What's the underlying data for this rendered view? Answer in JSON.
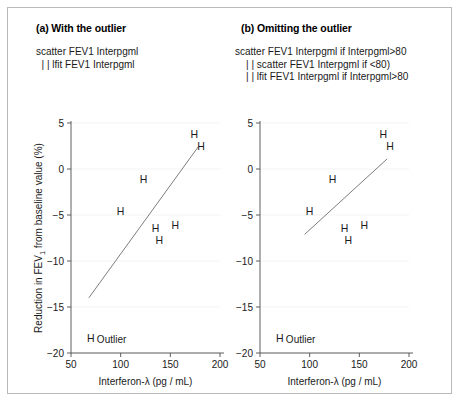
{
  "figure": {
    "panels": [
      {
        "id": "a",
        "title": "(a) With the outlier",
        "commands": "scatter FEV1 Interpgml\n  | | lfit FEV1 Interpgml"
      },
      {
        "id": "b",
        "title": "(b) Omitting the outlier",
        "commands": "scatter FEV1 Interpgml if Interpgml>80\n    | | scatter FEV1 Interpgml if <80)\n    | | lfit FEV1 Interpgml if Interpgml>80"
      }
    ],
    "outlier_label": "Outlier",
    "marker_glyph": "H",
    "colors": {
      "border": "#b9b9b9",
      "axis": "#4d4d4d",
      "grid": "#f0f0f0",
      "fit_line": "#6e6e6e",
      "text": "#1a1a1a",
      "background": "#ffffff"
    }
  },
  "chart_data": [
    {
      "type": "scatter",
      "panel": "a",
      "title": "(a) With the outlier",
      "xlabel": "Interferon-λ (pg / mL)",
      "ylabel": "Reduction in FEV₁ from baseline value (%)",
      "xlim": [
        50,
        200
      ],
      "ylim": [
        -20,
        5
      ],
      "xticks": [
        50,
        100,
        150,
        200
      ],
      "yticks": [
        5,
        0,
        -5,
        -10,
        -15,
        -20
      ],
      "xticklabels": [
        "50",
        "100",
        "150",
        "200"
      ],
      "yticklabels": [
        "5",
        "0",
        "−5",
        "−10",
        "−15",
        "−20"
      ],
      "grid": true,
      "legend": "none",
      "marker": "H",
      "points": [
        {
          "x": 100,
          "y": -4.6
        },
        {
          "x": 123,
          "y": -1.1
        },
        {
          "x": 135,
          "y": -6.4
        },
        {
          "x": 139,
          "y": -7.7
        },
        {
          "x": 155,
          "y": -6.1
        },
        {
          "x": 174,
          "y": 3.8
        },
        {
          "x": 181,
          "y": 2.5
        },
        {
          "x": 70,
          "y": -18.4,
          "annotation": "Outlier"
        }
      ],
      "fit_line": {
        "x0": 68,
        "y0": -14.0,
        "x1": 178,
        "y1": 2.4
      }
    },
    {
      "type": "scatter",
      "panel": "b",
      "title": "(b) Omitting the outlier",
      "xlabel": "Interferon-λ (pg / mL)",
      "ylabel": "",
      "xlim": [
        50,
        200
      ],
      "ylim": [
        -20,
        5
      ],
      "xticks": [
        50,
        100,
        150,
        200
      ],
      "yticks": [
        5,
        0,
        -5,
        -10,
        -15,
        -20
      ],
      "xticklabels": [
        "50",
        "100",
        "150",
        "200"
      ],
      "yticklabels": [
        "5",
        "0",
        "−5",
        "−10",
        "−15",
        "−20"
      ],
      "grid": true,
      "legend": "none",
      "marker": "H",
      "points": [
        {
          "x": 100,
          "y": -4.6
        },
        {
          "x": 123,
          "y": -1.1
        },
        {
          "x": 135,
          "y": -6.4
        },
        {
          "x": 139,
          "y": -7.7
        },
        {
          "x": 155,
          "y": -6.1
        },
        {
          "x": 174,
          "y": 3.8
        },
        {
          "x": 181,
          "y": 2.5
        },
        {
          "x": 70,
          "y": -18.4,
          "annotation": "Outlier"
        }
      ],
      "fit_line": {
        "x0": 95,
        "y0": -7.1,
        "x1": 178,
        "y1": 1.1
      }
    }
  ]
}
